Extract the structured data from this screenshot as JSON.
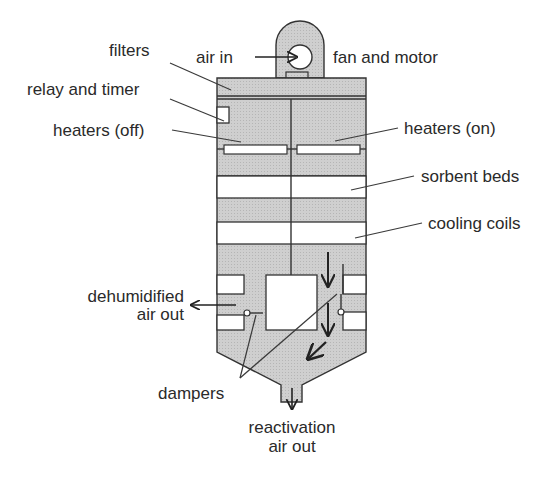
{
  "diagram": {
    "colors": {
      "body_fill": "#c9c9c9",
      "bed_fill": "#ffffff",
      "outline": "#333333",
      "text": "#2a2a2a"
    },
    "labels": {
      "air_in": "air in",
      "fan_and_motor": "fan and motor",
      "filters": "filters",
      "relay_and_timer": "relay and timer",
      "heaters_off": "heaters (off)",
      "heaters_on": "heaters (on)",
      "sorbent_beds": "sorbent beds",
      "cooling_coils": "cooling coils",
      "dehumidified_line1": "dehumidified",
      "dehumidified_line2": "air out",
      "dampers": "dampers",
      "reactivation_line1": "reactivation",
      "reactivation_line2": "air out"
    }
  }
}
